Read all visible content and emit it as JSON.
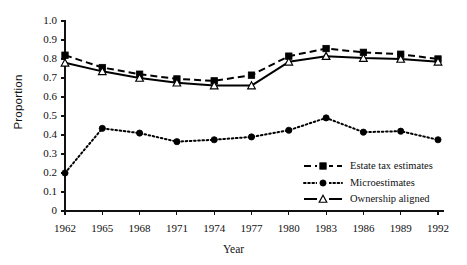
{
  "chart_data": {
    "type": "line",
    "title": "",
    "xlabel": "Year",
    "ylabel": "Proportion",
    "x": [
      1962,
      1965,
      1968,
      1971,
      1974,
      1977,
      1980,
      1983,
      1986,
      1989,
      1992
    ],
    "categories": [
      "1962",
      "1965",
      "1968",
      "1971",
      "1974",
      "1977",
      "1980",
      "1983",
      "1986",
      "1989",
      "1992"
    ],
    "xlim": [
      1962,
      1992
    ],
    "ylim": [
      0,
      1.0
    ],
    "ytick_labels": [
      "0",
      "0.1",
      "0.2",
      "0.3",
      "0.4",
      "0.5",
      "0.6",
      "0.7",
      "0.8",
      "0.9",
      "1.0"
    ],
    "ytick_values": [
      0,
      0.1,
      0.2,
      0.3,
      0.4,
      0.5,
      0.6,
      0.7,
      0.8,
      0.9,
      1.0
    ],
    "grid": false,
    "legend_position": "lower-right-inside",
    "series": [
      {
        "name": "Estate tax estimates",
        "marker": "filled-square",
        "line_style": "dashed",
        "color": "#000000",
        "values": [
          0.82,
          0.755,
          0.72,
          0.695,
          0.685,
          0.715,
          0.815,
          0.855,
          0.835,
          0.825,
          0.8
        ]
      },
      {
        "name": "Microestimates",
        "marker": "filled-circle",
        "line_style": "dotted",
        "color": "#000000",
        "values": [
          0.2,
          0.435,
          0.41,
          0.365,
          0.375,
          0.39,
          0.425,
          0.49,
          0.415,
          0.42,
          0.375
        ]
      },
      {
        "name": "Ownership aligned",
        "marker": "open-triangle",
        "line_style": "solid",
        "color": "#000000",
        "values": [
          0.78,
          0.735,
          0.7,
          0.675,
          0.66,
          0.66,
          0.785,
          0.815,
          0.805,
          0.8,
          0.785
        ]
      }
    ]
  },
  "legend": {
    "items": [
      {
        "label": "Estate tax estimates"
      },
      {
        "label": "Microestimates"
      },
      {
        "label": "Ownership aligned"
      }
    ]
  },
  "axes": {
    "y_title": "Proportion",
    "x_title": "Year"
  }
}
